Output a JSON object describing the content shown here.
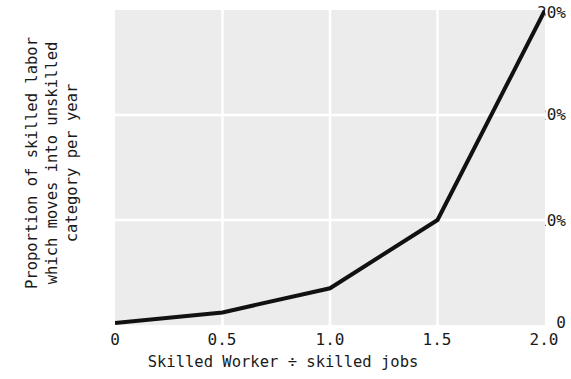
{
  "chart_data": {
    "type": "line",
    "title": "",
    "subtitle": "",
    "xlabel": "Skilled Worker ÷ skilled jobs",
    "ylabel_lines": [
      "Proportion of skilled labor",
      "which moves into unskilled",
      "category per year"
    ],
    "ylabel": "Proportion of skilled labor which moves into unskilled category per year",
    "x": [
      0,
      0.5,
      1.0,
      1.5,
      2.0
    ],
    "values": [
      0.2,
      1.2,
      3.5,
      10.0,
      30.0
    ],
    "series": [
      {
        "name": "skilled-to-unskilled transition rate",
        "values": [
          0.2,
          1.2,
          3.5,
          10.0,
          30.0
        ]
      }
    ],
    "xlim": [
      0,
      2.0
    ],
    "ylim": [
      0,
      30
    ],
    "xticks": [
      0,
      0.5,
      1.0,
      1.5,
      2.0
    ],
    "xtick_labels": [
      "0",
      "0.5",
      "1.0",
      "1.5",
      "2.0"
    ],
    "yticks": [
      0,
      10,
      20,
      30
    ],
    "ytick_labels": [
      "0",
      "10%",
      "20%",
      "30%"
    ],
    "grid": true,
    "grid_color": "#ffffff",
    "panel_color": "#ececec",
    "line_color": "#111111",
    "line_width": 4,
    "legend": false,
    "legend_position": "none"
  }
}
